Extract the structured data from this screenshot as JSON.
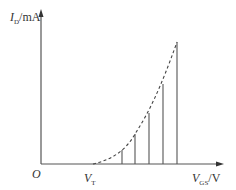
{
  "diagram": {
    "y_axis": {
      "symbol": "I",
      "subscript": "D",
      "unit": "/mA"
    },
    "x_axis": {
      "symbol": "V",
      "subscript": "GS",
      "unit": "/V"
    },
    "origin": "O",
    "threshold": {
      "symbol": "V",
      "subscript": "T"
    },
    "curve": "dashed parabolic transfer characteristic starting at V_T",
    "vertical_lines_count": 5,
    "line_color": "#444444"
  }
}
